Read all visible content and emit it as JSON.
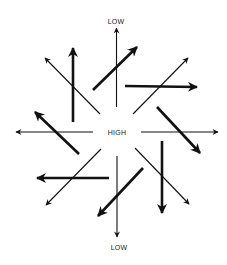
{
  "diagram": {
    "labels": {
      "top": "LOW",
      "center": "HIGH",
      "bottom": "LOW"
    },
    "label_positions": {
      "top": [
        116,
        21
      ],
      "center": [
        117,
        132
      ],
      "bottom": [
        119,
        247
      ]
    },
    "color": "#111111",
    "thin_arrows": [
      {
        "name": "thin-arrow-up",
        "from": [
          116.5,
          107
        ],
        "to": [
          116.5,
          28
        ]
      },
      {
        "name": "thin-arrow-down",
        "from": [
          117,
          156
        ],
        "to": [
          117,
          237
        ]
      },
      {
        "name": "thin-arrow-left",
        "from": [
          93,
          132
        ],
        "to": [
          16,
          132
        ]
      },
      {
        "name": "thin-arrow-right",
        "from": [
          141,
          132
        ],
        "to": [
          218,
          132
        ]
      },
      {
        "name": "thin-arrow-nw",
        "from": [
          100,
          114
        ],
        "to": [
          45,
          58
        ]
      },
      {
        "name": "thin-arrow-ne",
        "from": [
          133,
          114
        ],
        "to": [
          188,
          58
        ]
      },
      {
        "name": "thin-arrow-sw",
        "from": [
          101,
          149
        ],
        "to": [
          46,
          205
        ]
      },
      {
        "name": "thin-arrow-se",
        "from": [
          135,
          148
        ],
        "to": [
          189,
          204
        ]
      }
    ],
    "thick_arrows": [
      {
        "name": "thick-arrow-up",
        "from": [
          73,
          122
        ],
        "to": [
          73,
          48
        ]
      },
      {
        "name": "thick-arrow-ne",
        "from": [
          93,
          90
        ],
        "to": [
          137,
          47
        ]
      },
      {
        "name": "thick-arrow-right",
        "from": [
          125,
          86
        ],
        "to": [
          197,
          87
        ]
      },
      {
        "name": "thick-arrow-se",
        "from": [
          157,
          107
        ],
        "to": [
          200,
          153
        ]
      },
      {
        "name": "thick-arrow-down",
        "from": [
          162,
          141
        ],
        "to": [
          162,
          213
        ]
      },
      {
        "name": "thick-arrow-sw",
        "from": [
          143,
          168
        ],
        "to": [
          98,
          216
        ]
      },
      {
        "name": "thick-arrow-left",
        "from": [
          109,
          178
        ],
        "to": [
          37,
          178
        ]
      },
      {
        "name": "thick-arrow-nw",
        "from": [
          79,
          154
        ],
        "to": [
          35,
          112
        ]
      }
    ]
  }
}
